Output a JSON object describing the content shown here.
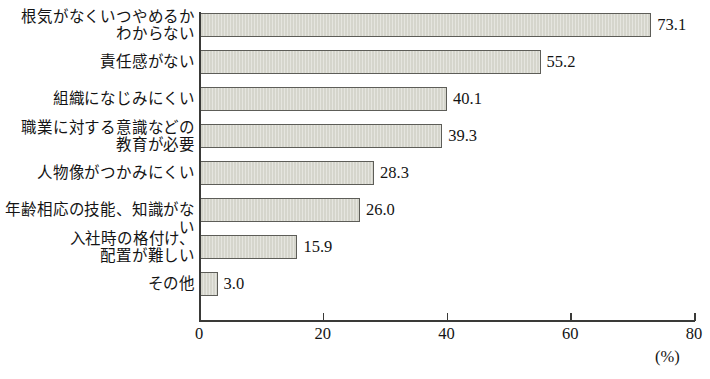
{
  "chart_data": {
    "type": "bar",
    "orientation": "horizontal",
    "title": "",
    "xlabel": "(%)",
    "ylabel": "",
    "xlim": [
      0,
      80
    ],
    "xticks": [
      0,
      20,
      40,
      60,
      80
    ],
    "grid": false,
    "legend": null,
    "categories": [
      "根気がなくいつやめるか\nわからない",
      "責任感がない",
      "組織になじみにくい",
      "職業に対する意識などの\n教育が必要",
      "人物像がつかみにくい",
      "年齢相応の技能、知識がない",
      "入社時の格付け、\n配置が難しい",
      "その他"
    ],
    "values": [
      73.1,
      55.2,
      40.1,
      39.3,
      28.3,
      26.0,
      15.9,
      3.0
    ],
    "value_labels": [
      "73.1",
      "55.2",
      "40.1",
      "39.3",
      "28.3",
      "26.0",
      "15.9",
      "3.0"
    ],
    "tick_labels": [
      "0",
      "20",
      "40",
      "60",
      "80"
    ]
  },
  "style": {
    "bar_fill": "#d5d5cc",
    "bar_border": "#5d5d58",
    "axis_color": "#3a3a38",
    "text_color": "#141414",
    "background": "#ffffff"
  }
}
